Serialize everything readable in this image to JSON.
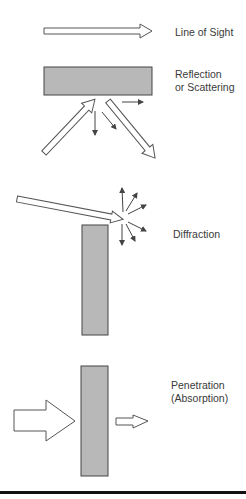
{
  "diagram": {
    "type": "propagation-mechanisms",
    "colors": {
      "obstacle": "#b8b8b8",
      "stroke": "#444444",
      "arrow_fill": "#ffffff",
      "rule": "#111111"
    },
    "panels": [
      {
        "id": "line-of-sight",
        "label": "Line of Sight"
      },
      {
        "id": "reflection",
        "label": "Reflection\nor Scattering"
      },
      {
        "id": "diffraction",
        "label": "Diffraction"
      },
      {
        "id": "penetration",
        "label": "Penetration\n(Absorption)"
      }
    ]
  }
}
